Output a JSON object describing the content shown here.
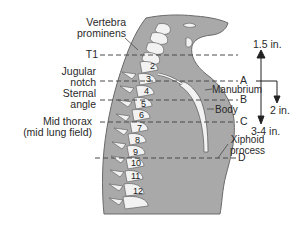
{
  "figure": {
    "type": "anatomical-diagram",
    "colors": {
      "tissue": "#a9a9a9",
      "tissue_edge": "#6a6a6a",
      "bone": "#f2f2f2",
      "bone_edge": "#555555",
      "line": "#4a4a4a",
      "text": "#2a2a2a"
    }
  },
  "left_labels": {
    "vertebra_prominens": [
      "Vertebra",
      "prominens"
    ],
    "t1": "T1",
    "jugular_notch": [
      "Jugular",
      "notch"
    ],
    "sternal_angle": [
      "Sternal",
      "angle"
    ],
    "mid_thorax": [
      "Mid thorax",
      "(mid lung field)"
    ]
  },
  "vertebra_numbers": [
    "2",
    "3",
    "4",
    "5",
    "6",
    "7",
    "8",
    "9",
    "10",
    "11",
    "12"
  ],
  "sternum_labels": {
    "manubrium": "Manubrium",
    "body": "Body",
    "xiphoid": [
      "Xiphoid",
      "process"
    ]
  },
  "level_markers": [
    "A",
    "B",
    "C",
    "D"
  ],
  "measurements": {
    "up": "1.5 in.",
    "down_short": "2 in.",
    "down_long": "3-4 in."
  }
}
